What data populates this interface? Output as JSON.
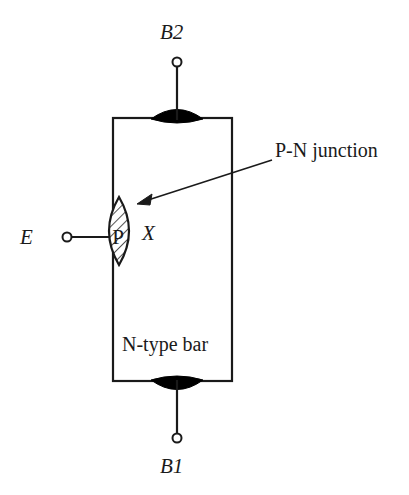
{
  "figure": {
    "background_color": "#ffffff",
    "line_color": "#1a1a1a",
    "fill_color": "#000000"
  },
  "labels": {
    "base_two": "B2",
    "base_one": "B1",
    "emitter": "E",
    "point_x": "X",
    "junction": "P-N junction",
    "bar": "N-type bar",
    "p_region": "P"
  },
  "geometry": {
    "bar": {
      "x": 113,
      "y": 118,
      "width": 119,
      "height": 263
    },
    "top_contact": {
      "cx": 177,
      "cy": 118,
      "rx": 26,
      "ry": 8
    },
    "bottom_contact": {
      "cx": 177,
      "cy": 381,
      "rx": 26,
      "ry": 8
    },
    "terminal_b2": {
      "cx": 177,
      "cy": 62,
      "r": 4.5
    },
    "terminal_b1": {
      "cx": 177,
      "cy": 438,
      "r": 4.5
    },
    "terminal_e": {
      "cx": 67,
      "cy": 237,
      "r": 4.5
    },
    "p_lens": {
      "cx": 119,
      "cy": 231,
      "half_width": 19,
      "half_height": 34
    },
    "arrow": {
      "x1": 272,
      "y1": 160,
      "x2": 139,
      "y2": 203
    }
  }
}
